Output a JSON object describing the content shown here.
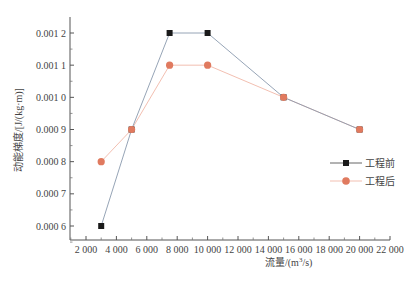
{
  "chart_data": {
    "type": "line",
    "title": "",
    "xlabel": "流量/(m³/s)",
    "xlabel_main": "流量/(m",
    "xlabel_sup": "3",
    "xlabel_tail": "/s)",
    "ylabel": "动能梯度/[J/(kg·m)]",
    "xlim": [
      1000,
      22000
    ],
    "ylim": [
      0.00055,
      0.00125
    ],
    "grid": false,
    "legend_position": "right-center",
    "x_ticks": [
      2000,
      4000,
      6000,
      8000,
      10000,
      12000,
      14000,
      16000,
      18000,
      20000,
      22000
    ],
    "x_tick_labels": [
      "2 000",
      "4 000",
      "6 000",
      "8 000",
      "10 000",
      "12 000",
      "14 000",
      "16 000",
      "18 000",
      "20 000",
      "22 000"
    ],
    "y_ticks": [
      0.0006,
      0.0007,
      0.0008,
      0.0009,
      0.001,
      0.0011,
      0.0012
    ],
    "y_tick_labels": [
      "0.000 6",
      "0.000 7",
      "0.000 8",
      "0.000 9",
      "0.001 0",
      "0.001 1",
      "0.001 2"
    ],
    "series": [
      {
        "name": "工程前",
        "marker": "square",
        "color": "#1a1a1a",
        "line_color": "#8a9aae",
        "x": [
          3000,
          5000,
          7500,
          10000,
          15000,
          20000
        ],
        "values": [
          0.0006,
          0.0009,
          0.0012,
          0.0012,
          0.001,
          0.0009
        ]
      },
      {
        "name": "工程后",
        "marker": "circle",
        "color": "#e07a5f",
        "line_color": "#f0b8a8",
        "x": [
          3000,
          5000,
          7500,
          10000,
          15000,
          20000
        ],
        "values": [
          0.0008,
          0.0009,
          0.0011,
          0.0011,
          0.001,
          0.0009
        ]
      }
    ]
  },
  "legend": {
    "items": [
      {
        "label": "工程前"
      },
      {
        "label": "工程后"
      }
    ]
  }
}
